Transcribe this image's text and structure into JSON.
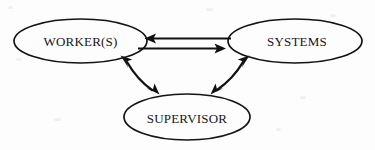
{
  "diagram": {
    "background_color": "#fdfdfd",
    "stroke_color": "#111114",
    "text_color": "#16161a",
    "nodes": [
      {
        "id": "workers",
        "label": "WORKER(S)",
        "shape": "ellipse",
        "cx": 80.5,
        "cy": 41,
        "rx": 66.5,
        "ry": 22
      },
      {
        "id": "systems",
        "label": "SYSTEMS",
        "shape": "ellipse",
        "cx": 295,
        "cy": 41,
        "rx": 67,
        "ry": 22
      },
      {
        "id": "supervisor",
        "label": "SUPERVISOR",
        "shape": "ellipse",
        "cx": 187,
        "cy": 117,
        "rx": 63,
        "ry": 23
      }
    ],
    "edges": [
      {
        "id": "systems-to-workers",
        "from": "systems",
        "to": "workers",
        "style": "straight",
        "direction": "left",
        "arrowheads": 1
      },
      {
        "id": "workers-to-systems",
        "from": "workers",
        "to": "systems",
        "style": "straight",
        "direction": "right",
        "arrowheads": 1
      },
      {
        "id": "workers-supervisor",
        "from": "workers",
        "to": "supervisor",
        "style": "curved",
        "direction": "both",
        "arrowheads": 2
      },
      {
        "id": "systems-supervisor",
        "from": "systems",
        "to": "supervisor",
        "style": "curved",
        "direction": "both",
        "arrowheads": 2
      }
    ]
  }
}
